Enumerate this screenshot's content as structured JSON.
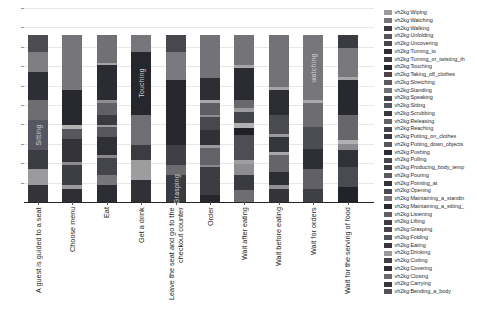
{
  "chart_data": {
    "type": "bar",
    "subtype": "stacked-vertical-normalized",
    "title": "",
    "xlabel": "",
    "ylabel": "",
    "x_tick_rotation": 90,
    "y_tick_labels_visible": false,
    "ylim": [
      0,
      1.2
    ],
    "grid": true,
    "legend_position": "right",
    "background": "#ffffff",
    "categories": [
      "A guest is guided to a seat",
      "Choose menu",
      "Eat",
      "Get a drink",
      "Leave the seat and go to the\ncheckout counter",
      "Order",
      "Wait after eating",
      "Wait before eating",
      "Wait for orders",
      "Wait for the serving of food"
    ],
    "bar_inner_labels": [
      "Sitting",
      "Touching",
      "Grasping",
      "watching"
    ],
    "legend": [
      {
        "label": "vh2kg:Wiping",
        "color": "#9a9a9d"
      },
      {
        "label": "vh2kg:Watching",
        "color": "#77777b"
      },
      {
        "label": "vh2kg:Walking",
        "color": "#3a3a41"
      },
      {
        "label": "vh2kg:Unfolding",
        "color": "#55555b"
      },
      {
        "label": "vh2kg:Uncovering",
        "color": "#47474d"
      },
      {
        "label": "vh2kg:Turning_to",
        "color": "#2e2e35"
      },
      {
        "label": "vh2kg:Turning_or_twisting_th",
        "color": "#3d3d44"
      },
      {
        "label": "vh2kg:Touching",
        "color": "#26262d"
      },
      {
        "label": "vh2kg:Taking_off_clothes",
        "color": "#4e444a"
      },
      {
        "label": "vh2kg:Stretching",
        "color": "#5a5a60"
      },
      {
        "label": "vh2kg:Standing",
        "color": "#737377"
      },
      {
        "label": "vh2kg:Speaking",
        "color": "#414148"
      },
      {
        "label": "vh2kg:Sitting",
        "color": "#565660"
      },
      {
        "label": "vh2kg:Scrubbing",
        "color": "#37373d"
      },
      {
        "label": "vh2kg:Releasing",
        "color": "#626267"
      },
      {
        "label": "vh2kg:Reaching",
        "color": "#44444b"
      },
      {
        "label": "vh2kg:Putting_on_clothes",
        "color": "#393940"
      },
      {
        "label": "vh2kg:Putting_down_objects",
        "color": "#57575c"
      },
      {
        "label": "vh2kg:Pushing",
        "color": "#2c2c33"
      },
      {
        "label": "vh2kg:Pulling",
        "color": "#484850"
      },
      {
        "label": "vh2kg:Producing_body_temp",
        "color": "#3f3f46"
      },
      {
        "label": "vh2kg:Pouring",
        "color": "#595960"
      },
      {
        "label": "vh2kg:Pointing_at",
        "color": "#333339"
      },
      {
        "label": "vh2kg:Opening",
        "color": "#4b4b51"
      },
      {
        "label": "vh2kg:Maintaining_a_standin",
        "color": "#757579"
      },
      {
        "label": "vh2kg:Maintaining_a_sitting_",
        "color": "#2a2a31"
      },
      {
        "label": "vh2kg:Listening",
        "color": "#606066"
      },
      {
        "label": "vh2kg:Lifting",
        "color": "#3c3c42"
      },
      {
        "label": "vh2kg:Grasping",
        "color": "#45454b"
      },
      {
        "label": "vh2kg:Folding",
        "color": "#515158"
      },
      {
        "label": "vh2kg:Eating",
        "color": "#36363c"
      },
      {
        "label": "vh2kg:Drinking",
        "color": "#9b9b9e"
      },
      {
        "label": "vh2kg:Cutting",
        "color": "#404046"
      },
      {
        "label": "vh2kg:Covering",
        "color": "#2e2e35"
      },
      {
        "label": "vh2kg:Closing",
        "color": "#6a6a6e"
      },
      {
        "label": "vh2kg:Carrying",
        "color": "#38383e"
      },
      {
        "label": "vh2kg:Bending_a_body",
        "color": "#53535a"
      }
    ],
    "bars": [
      {
        "category": "A guest is guided to a seat",
        "segments": [
          {
            "color": "#4c4c52",
            "pct": 10
          },
          {
            "color": "#7e7e82",
            "pct": 12
          },
          {
            "color": "#2e2e36",
            "pct": 17
          },
          {
            "color": "#6e6e72",
            "pct": 12
          },
          {
            "color": "#565660",
            "pct": 18,
            "text": "Sitting"
          },
          {
            "color": "#3b3b42",
            "pct": 11
          },
          {
            "color": "#9b9b9e",
            "pct": 10
          },
          {
            "color": "#333339",
            "pct": 10
          }
        ]
      },
      {
        "category": "Choose menu",
        "segments": [
          {
            "color": "#757579",
            "pct": 33
          },
          {
            "color": "#28282f",
            "pct": 21
          },
          {
            "color": "#b2b2b5",
            "pct": 2
          },
          {
            "color": "#57575d",
            "pct": 6
          },
          {
            "color": "#333339",
            "pct": 14
          },
          {
            "color": "#8c8c90",
            "pct": 2
          },
          {
            "color": "#3d3d44",
            "pct": 12
          },
          {
            "color": "#9b9b9e",
            "pct": 2
          },
          {
            "color": "#2e2e34",
            "pct": 8
          }
        ]
      },
      {
        "category": "Eat",
        "segments": [
          {
            "color": "#717175",
            "pct": 17
          },
          {
            "color": "#a5a5a8",
            "pct": 1
          },
          {
            "color": "#2b2b32",
            "pct": 21
          },
          {
            "color": "#8e8e92",
            "pct": 2
          },
          {
            "color": "#606066",
            "pct": 7
          },
          {
            "color": "#3a3a41",
            "pct": 6
          },
          {
            "color": "#9b9b9e",
            "pct": 1
          },
          {
            "color": "#56565c",
            "pct": 6
          },
          {
            "color": "#2f2f36",
            "pct": 11
          },
          {
            "color": "#88888c",
            "pct": 2
          },
          {
            "color": "#44444b",
            "pct": 10
          },
          {
            "color": "#76767a",
            "pct": 6
          },
          {
            "color": "#2c2c33",
            "pct": 10
          }
        ]
      },
      {
        "category": "Get a drink",
        "segments": [
          {
            "color": "#77777b",
            "pct": 10
          },
          {
            "color": "#26262d",
            "pct": 38,
            "text": "Touching"
          },
          {
            "color": "#6f6f73",
            "pct": 18
          },
          {
            "color": "#3b3b42",
            "pct": 9
          },
          {
            "color": "#9d9da0",
            "pct": 12
          },
          {
            "color": "#303037",
            "pct": 13
          }
        ]
      },
      {
        "category": "Leave the seat and go to the checkout counter",
        "segments": [
          {
            "color": "#47474e",
            "pct": 10
          },
          {
            "color": "#7a7a7e",
            "pct": 17
          },
          {
            "color": "#26262d",
            "pct": 39
          },
          {
            "color": "#3f3f46",
            "pct": 12
          },
          {
            "color": "#6c6c70",
            "pct": 6
          },
          {
            "color": "#3a3a41",
            "pct": 16,
            "text": "Grasping"
          }
        ]
      },
      {
        "category": "Order",
        "segments": [
          {
            "color": "#737377",
            "pct": 26
          },
          {
            "color": "#2c2c33",
            "pct": 13
          },
          {
            "color": "#a8a8ab",
            "pct": 2
          },
          {
            "color": "#5d5d63",
            "pct": 7
          },
          {
            "color": "#8e8e92",
            "pct": 1
          },
          {
            "color": "#47474e",
            "pct": 8
          },
          {
            "color": "#303037",
            "pct": 9
          },
          {
            "color": "#9b9b9e",
            "pct": 2
          },
          {
            "color": "#626267",
            "pct": 10
          },
          {
            "color": "#89898d",
            "pct": 1
          },
          {
            "color": "#3c3c43",
            "pct": 17
          },
          {
            "color": "#26262d",
            "pct": 4
          }
        ]
      },
      {
        "category": "Wait after eating",
        "segments": [
          {
            "color": "#747478",
            "pct": 18
          },
          {
            "color": "#a6a6a9",
            "pct": 2
          },
          {
            "color": "#2b2b32",
            "pct": 19
          },
          {
            "color": "#68686d",
            "pct": 5
          },
          {
            "color": "#9c9c9f",
            "pct": 2
          },
          {
            "color": "#44444b",
            "pct": 7
          },
          {
            "color": "#b0b0b3",
            "pct": 3
          },
          {
            "color": "#202027",
            "pct": 4
          },
          {
            "color": "#4d4d53",
            "pct": 15
          },
          {
            "color": "#a0a0a3",
            "pct": 2
          },
          {
            "color": "#8e8e92",
            "pct": 7
          },
          {
            "color": "#3a3a41",
            "pct": 9
          },
          {
            "color": "#6e6e72",
            "pct": 7
          }
        ]
      },
      {
        "category": "Wait before eating",
        "segments": [
          {
            "color": "#737377",
            "pct": 31
          },
          {
            "color": "#a4a4a7",
            "pct": 2
          },
          {
            "color": "#2c2c33",
            "pct": 15
          },
          {
            "color": "#4a4a51",
            "pct": 11
          },
          {
            "color": "#9a9a9d",
            "pct": 2
          },
          {
            "color": "#35353c",
            "pct": 9
          },
          {
            "color": "#a8a8ab",
            "pct": 2
          },
          {
            "color": "#646469",
            "pct": 10
          },
          {
            "color": "#2e2e35",
            "pct": 8
          },
          {
            "color": "#909094",
            "pct": 2
          },
          {
            "color": "#333339",
            "pct": 8
          }
        ]
      },
      {
        "category": "Wait for orders",
        "segments": [
          {
            "color": "#77777b",
            "pct": 39,
            "text": "watching"
          },
          {
            "color": "#a9a9ac",
            "pct": 2
          },
          {
            "color": "#6d6d71",
            "pct": 14
          },
          {
            "color": "#4c4c53",
            "pct": 13
          },
          {
            "color": "#2e2e35",
            "pct": 12
          },
          {
            "color": "#606066",
            "pct": 12
          },
          {
            "color": "#3f3f46",
            "pct": 8
          }
        ]
      },
      {
        "category": "Wait for the serving of food",
        "segments": [
          {
            "color": "#3a3a41",
            "pct": 8
          },
          {
            "color": "#78787c",
            "pct": 17
          },
          {
            "color": "#a5a5a8",
            "pct": 2
          },
          {
            "color": "#28282f",
            "pct": 21
          },
          {
            "color": "#66666b",
            "pct": 15
          },
          {
            "color": "#b1b1b4",
            "pct": 2
          },
          {
            "color": "#8b8b8f",
            "pct": 4
          },
          {
            "color": "#313138",
            "pct": 10
          },
          {
            "color": "#4a4a51",
            "pct": 12
          },
          {
            "color": "#222229",
            "pct": 9
          }
        ]
      }
    ]
  }
}
